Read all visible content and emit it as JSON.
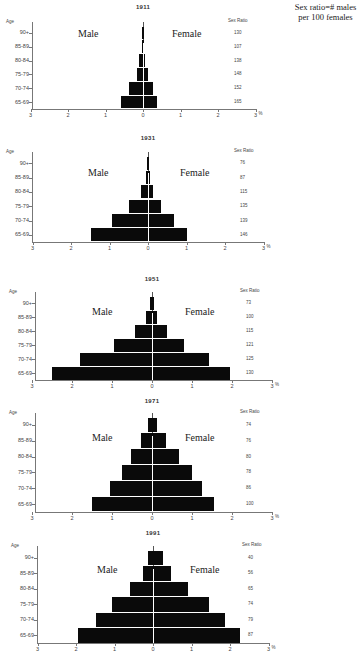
{
  "note": "Sex ratio=# males per 100 females",
  "labels": {
    "age_header": "Age",
    "sex_ratio_header": "Sex Ratio",
    "male": "Male",
    "female": "Female",
    "percent": "%",
    "ages": [
      "90+",
      "85-89",
      "80-84",
      "75-79",
      "70-74",
      "65-69"
    ],
    "x_ticks": [
      "3",
      "2",
      "1",
      "0",
      "1",
      "2",
      "3"
    ]
  },
  "chart_data": [
    {
      "type": "bar",
      "subtype": "population-pyramid",
      "title": "1911",
      "categories": [
        "90+",
        "85-89",
        "80-84",
        "75-79",
        "70-74",
        "65-69"
      ],
      "series": [
        {
          "name": "Male",
          "values": [
            0.01,
            0.02,
            0.1,
            0.17,
            0.38,
            0.6
          ]
        },
        {
          "name": "Female",
          "values": [
            0.01,
            0.02,
            0.06,
            0.12,
            0.26,
            0.37
          ]
        }
      ],
      "sex_ratio": [
        130,
        107,
        138,
        148,
        152,
        165
      ],
      "xlabel": "%",
      "ylabel": "Age",
      "xlim": [
        -3,
        3
      ]
    },
    {
      "type": "bar",
      "subtype": "population-pyramid",
      "title": "1931",
      "categories": [
        "90+",
        "85-89",
        "80-84",
        "75-79",
        "70-74",
        "65-69"
      ],
      "series": [
        {
          "name": "Male",
          "values": [
            0.01,
            0.05,
            0.18,
            0.49,
            0.93,
            1.48
          ]
        },
        {
          "name": "Female",
          "values": [
            0.01,
            0.05,
            0.13,
            0.34,
            0.67,
            1.0
          ]
        }
      ],
      "sex_ratio": [
        76,
        87,
        115,
        135,
        139,
        146
      ],
      "xlabel": "%",
      "ylabel": "Age",
      "xlim": [
        -3,
        3
      ]
    },
    {
      "type": "bar",
      "subtype": "population-pyramid",
      "title": "1951",
      "categories": [
        "90+",
        "85-89",
        "80-84",
        "75-79",
        "70-74",
        "65-69"
      ],
      "series": [
        {
          "name": "Male",
          "values": [
            0.05,
            0.15,
            0.42,
            0.95,
            1.8,
            2.5
          ]
        },
        {
          "name": "Female",
          "values": [
            0.05,
            0.12,
            0.37,
            0.8,
            1.43,
            1.95
          ]
        }
      ],
      "sex_ratio": [
        73,
        100,
        115,
        121,
        125,
        130
      ],
      "xlabel": "%",
      "ylabel": "Age",
      "xlim": [
        -3,
        3
      ]
    },
    {
      "type": "bar",
      "subtype": "population-pyramid",
      "title": "1971",
      "categories": [
        "90+",
        "85-89",
        "80-84",
        "75-79",
        "70-74",
        "65-69"
      ],
      "series": [
        {
          "name": "Male",
          "values": [
            0.1,
            0.28,
            0.53,
            0.75,
            1.05,
            1.5
          ]
        },
        {
          "name": "Female",
          "values": [
            0.12,
            0.35,
            0.67,
            0.99,
            1.25,
            1.55
          ]
        }
      ],
      "sex_ratio": [
        74,
        76,
        80,
        78,
        86,
        100
      ],
      "xlabel": "%",
      "ylabel": "Age",
      "xlim": [
        -3,
        3
      ]
    },
    {
      "type": "bar",
      "subtype": "population-pyramid",
      "title": "1991",
      "categories": [
        "90+",
        "85-89",
        "80-84",
        "75-79",
        "70-74",
        "65-69"
      ],
      "series": [
        {
          "name": "Male",
          "values": [
            0.12,
            0.26,
            0.6,
            1.07,
            1.47,
            1.95
          ]
        },
        {
          "name": "Female",
          "values": [
            0.26,
            0.46,
            0.9,
            1.45,
            1.87,
            2.25
          ]
        }
      ],
      "sex_ratio": [
        40,
        56,
        65,
        74,
        79,
        87
      ],
      "xlabel": "%",
      "ylabel": "Age",
      "xlim": [
        -3,
        3
      ]
    }
  ]
}
